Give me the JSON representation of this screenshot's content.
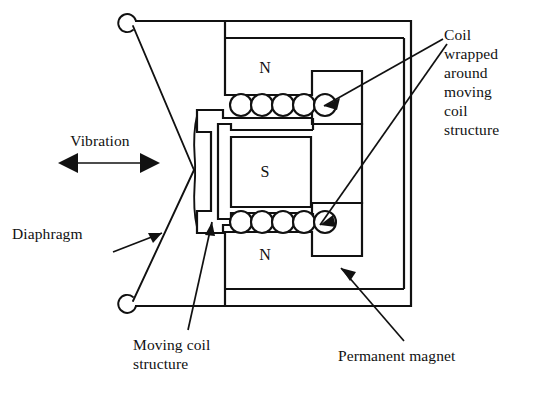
{
  "figure": {
    "background_color": "#ffffff",
    "line_color": "#111111"
  },
  "pole_labels": {
    "north_top": "N",
    "south_middle": "S",
    "north_bottom": "N"
  },
  "labels": {
    "coil_wrapped": "Coil\nwrapped\naround\nmoving\ncoil\nstructure",
    "vibration": "Vibration",
    "diaphragm": "Diaphragm",
    "moving_coil_structure": "Moving coil\nstructure",
    "permanent_magnet": "Permanent magnet"
  },
  "components": {
    "coil_turn_count_top": 5,
    "coil_turn_count_bottom": 5,
    "vibration_arrow_direction": "double-headed-horizontal"
  },
  "icons": {
    "vibration_arrow": "double-arrow-icon",
    "leader_arrow": "arrow-icon"
  }
}
